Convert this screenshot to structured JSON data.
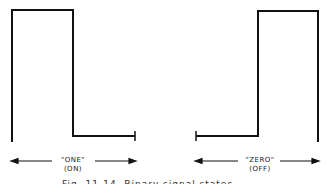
{
  "figure": {
    "left_panel": {
      "label": "\"ONE\"",
      "sublabel": "(ON)"
    },
    "right_panel": {
      "label": "\"ZERO\"",
      "sublabel": "(OFF)"
    },
    "caption": "Fig. 11-14. Binary signal states"
  },
  "colors": {
    "line": "#111111",
    "background": "#ffffff"
  }
}
